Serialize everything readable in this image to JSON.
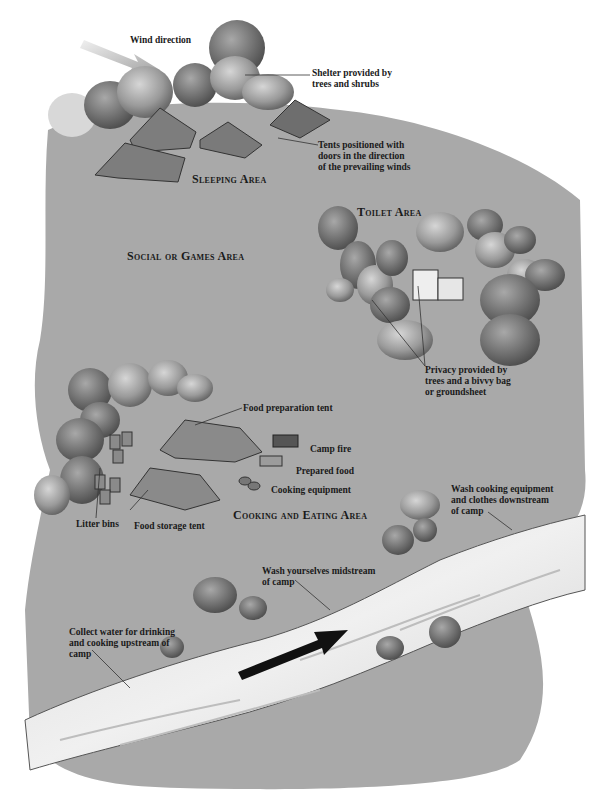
{
  "colors": {
    "ground": "#a9a9a9",
    "ground_dark": "#8e8e8e",
    "water": "#e6e6e6",
    "bush_light": "#c8c8c8",
    "bush_dark": "#6e6e6e",
    "tent": "#7d7d7d",
    "text": "#1a1a1a",
    "arrow": "#111111",
    "wind_arrow": "#b8b8b8"
  },
  "areas": {
    "sleeping": "Sleeping Area",
    "social": "Social or Games Area",
    "toilet": "Toilet Area",
    "cooking": "Cooking and Eating Area"
  },
  "labels": {
    "wind_direction": "Wind direction",
    "shelter": "Shelter provided by\ntrees and shrubs",
    "tents_positioned": "Tents positioned with\ndoors in the direction\nof the prevailing winds",
    "privacy": "Privacy provided by\ntrees and a bivvy bag\nor groundsheet",
    "food_prep_tent": "Food preparation tent",
    "camp_fire": "Camp fire",
    "prepared_food": "Prepared food",
    "cooking_equipment": "Cooking equipment",
    "litter_bins": "Litter bins",
    "food_storage_tent": "Food storage tent",
    "wash_cooking": "Wash cooking equipment\nand clothes downstream\nof camp",
    "wash_yourselves": "Wash yourselves midstream\nof camp",
    "collect_water": "Collect water for drinking\nand cooking upstream of\ncamp"
  },
  "icons": {
    "wind_arrow": "wind-direction-arrow-icon",
    "stream_arrow": "stream-flow-arrow-icon"
  }
}
